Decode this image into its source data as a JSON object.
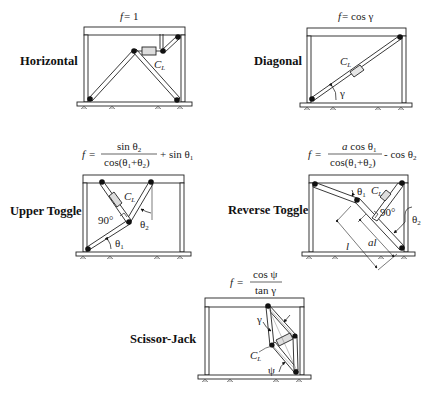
{
  "figure": {
    "panels": [
      {
        "name": "Horizontal",
        "label": "Horizontal",
        "equation": {
          "lhs": "f",
          "rhs": "= 1"
        },
        "damper_label": "C",
        "damper_sub": "L"
      },
      {
        "name": "Diagonal",
        "label": "Diagonal",
        "equation": {
          "lhs": "f",
          "rhs": "= cos γ"
        },
        "damper_label": "C",
        "damper_sub": "L",
        "angle_label": "γ"
      },
      {
        "name": "Upper Toggle",
        "label": "Upper Toggle",
        "equation": {
          "lhs": "f",
          "eq": "=",
          "numerator": "sin θ",
          "numerator_sub": "2",
          "denominator": "cos(θ",
          "denominator_sub1": "1",
          "denominator_mid": "+θ",
          "denominator_sub2": "2",
          "denominator_end": ")",
          "tail": "+ sin θ",
          "tail_sub": "1"
        },
        "damper_label": "C",
        "damper_sub": "L",
        "right_angle_label": "90°",
        "angle1_label": "θ",
        "angle1_sub": "1",
        "angle2_label": "θ",
        "angle2_sub": "2"
      },
      {
        "name": "Reverse Toggle",
        "label": "Reverse Toggle",
        "equation": {
          "lhs": "f",
          "eq": "=",
          "numerator_a": "a",
          "numerator": " cos θ",
          "numerator_sub": "1",
          "denominator": "cos(θ",
          "denominator_sub1": "1",
          "denominator_mid": "+θ",
          "denominator_sub2": "2",
          "denominator_end": ")",
          "tail": "- cos θ",
          "tail_sub": "2"
        },
        "damper_label": "C",
        "damper_sub": "L",
        "right_angle_label": "90°",
        "angle1_label": "θ",
        "angle1_sub": "1",
        "angle2_label": "θ",
        "angle2_sub": "2",
        "length_label": "l",
        "partial_length_label": "al"
      },
      {
        "name": "Scissor-Jack",
        "label": "Scissor-Jack",
        "equation": {
          "lhs": "f",
          "eq": "=",
          "numerator": "cos ψ",
          "denominator": "tan γ"
        },
        "damper_label": "C",
        "damper_sub": "L",
        "angle_gamma": "γ",
        "angle_psi": "ψ"
      }
    ]
  }
}
